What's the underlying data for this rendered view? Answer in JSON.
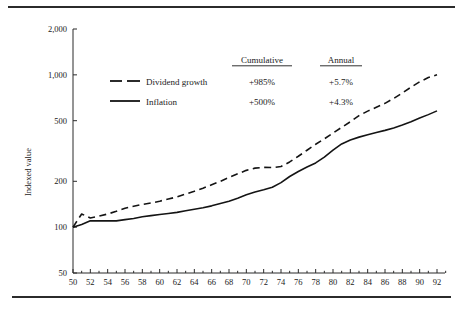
{
  "chart_data": {
    "type": "line",
    "title": "",
    "xlabel": "",
    "ylabel": "Indexed value",
    "yscale": "log",
    "ylim": [
      50,
      2000
    ],
    "xlim": [
      50,
      93
    ],
    "grid": false,
    "legend_position": "upper-left-inside",
    "y_ticks": [
      50,
      100,
      200,
      500,
      1000,
      2000
    ],
    "y_tick_labels": [
      "50",
      "100",
      "200",
      "500",
      "1,000",
      "2,000"
    ],
    "x_ticks": [
      50,
      52,
      54,
      56,
      58,
      60,
      62,
      64,
      66,
      68,
      70,
      72,
      74,
      76,
      78,
      80,
      82,
      84,
      86,
      88,
      90,
      92
    ],
    "x_tick_labels": [
      "50",
      "52",
      "54",
      "56",
      "58",
      "60",
      "62",
      "64",
      "66",
      "68",
      "70",
      "72",
      "74",
      "76",
      "78",
      "80",
      "82",
      "84",
      "86",
      "88",
      "90",
      "92"
    ],
    "x_minor_ticks": [
      51,
      53,
      55,
      57,
      59,
      61,
      63,
      65,
      67,
      69,
      71,
      73,
      75,
      77,
      79,
      81,
      83,
      85,
      87,
      89,
      91,
      93
    ],
    "x": [
      50,
      51,
      52,
      53,
      54,
      55,
      56,
      57,
      58,
      59,
      60,
      61,
      62,
      63,
      64,
      65,
      66,
      67,
      68,
      69,
      70,
      71,
      72,
      73,
      74,
      75,
      76,
      77,
      78,
      79,
      80,
      81,
      82,
      83,
      84,
      85,
      86,
      87,
      88,
      89,
      90,
      91,
      92
    ],
    "series": [
      {
        "name": "Dividend growth",
        "style": "dashed",
        "values": [
          100,
          122,
          115,
          118,
          122,
          127,
          133,
          137,
          141,
          144,
          148,
          153,
          158,
          165,
          172,
          180,
          190,
          200,
          212,
          224,
          236,
          244,
          247,
          246,
          250,
          268,
          292,
          320,
          350,
          380,
          415,
          452,
          492,
          540,
          578,
          612,
          650,
          700,
          760,
          830,
          900,
          960,
          1000
        ],
        "cumulative": "+985%",
        "annual": "+5.7%"
      },
      {
        "name": "Inflation",
        "style": "solid",
        "values": [
          100,
          104,
          110,
          110,
          110,
          110,
          112,
          114,
          117,
          119,
          121,
          123,
          125,
          128,
          131,
          134,
          138,
          143,
          148,
          155,
          163,
          170,
          176,
          183,
          196,
          215,
          232,
          248,
          264,
          288,
          320,
          352,
          374,
          390,
          404,
          418,
          432,
          448,
          468,
          492,
          520,
          548,
          580
        ],
        "cumulative": "+500%",
        "annual": "+4.3%"
      }
    ]
  },
  "legend": {
    "items": [
      {
        "label": "Dividend growth",
        "style": "dashed"
      },
      {
        "label": "Inflation",
        "style": "solid"
      }
    ]
  },
  "annotation_table": {
    "headers": [
      "Cumulative",
      "Annual"
    ],
    "rows": [
      {
        "cumulative": "+985%",
        "annual": "+5.7%"
      },
      {
        "cumulative": "+500%",
        "annual": "+4.3%"
      }
    ]
  }
}
